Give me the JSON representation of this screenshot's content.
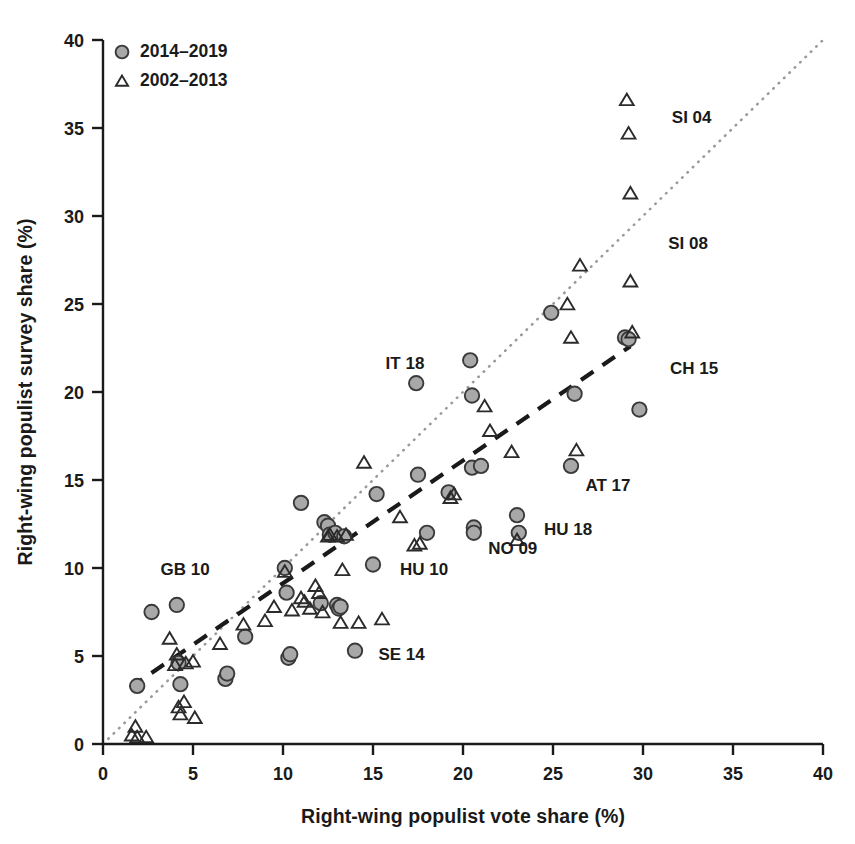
{
  "chart_data": {
    "type": "scatter",
    "title": "",
    "xlabel": "Right-wing populist vote share (%)",
    "ylabel": "Right-wing populist survey share (%)",
    "xlim": [
      0,
      40
    ],
    "ylim": [
      0,
      40
    ],
    "xticks": [
      0,
      5,
      10,
      15,
      20,
      25,
      30,
      35,
      40
    ],
    "yticks": [
      0,
      5,
      10,
      15,
      20,
      25,
      30,
      35,
      40
    ],
    "xtick_labels": [
      "0",
      "5",
      "10",
      "15",
      "20",
      "25",
      "30",
      "35",
      "40"
    ],
    "ytick_labels": [
      "0",
      "5",
      "10",
      "15",
      "20",
      "25",
      "30",
      "35",
      "40"
    ],
    "grid": false,
    "legend_position": "top-left",
    "colors": {
      "circle_fill": "#a8a8a8",
      "circle_edge": "#3a3a3a",
      "triangle_edge": "#2b2b2b",
      "triangle_fill": "none",
      "axis": "#1a1a1a",
      "identity_line": "#9a9a9a",
      "fit_line": "#1a1a1a"
    },
    "legend": [
      {
        "label": "2014–2019",
        "marker": "circle"
      },
      {
        "label": "2002–2013",
        "marker": "triangle"
      }
    ],
    "reference_lines": [
      {
        "name": "identity-line",
        "style": "dotted",
        "color": "#9a9a9a",
        "x0": 0,
        "y0": 0,
        "x1": 40,
        "y1": 40
      },
      {
        "name": "fit-line",
        "style": "dashed",
        "color": "#1a1a1a",
        "x0": 1.5,
        "y0": 3.2,
        "x1": 29.3,
        "y1": 22.6
      }
    ],
    "series": [
      {
        "name": "2014–2019",
        "marker": "circle",
        "points": [
          [
            1.9,
            3.3
          ],
          [
            2.7,
            7.5
          ],
          [
            4.1,
            7.9
          ],
          [
            4.2,
            4.6
          ],
          [
            4.3,
            3.4
          ],
          [
            6.8,
            3.7
          ],
          [
            6.9,
            4.0
          ],
          [
            7.9,
            6.1
          ],
          [
            10.1,
            10.0
          ],
          [
            10.2,
            8.6
          ],
          [
            10.3,
            4.9
          ],
          [
            10.4,
            5.1
          ],
          [
            11.0,
            13.7
          ],
          [
            12.1,
            8.0
          ],
          [
            12.3,
            12.6
          ],
          [
            12.5,
            12.4
          ],
          [
            12.6,
            11.9
          ],
          [
            12.9,
            12.0
          ],
          [
            13.0,
            7.9
          ],
          [
            13.1,
            7.7
          ],
          [
            13.2,
            7.8
          ],
          [
            13.4,
            11.8
          ],
          [
            14.0,
            5.3
          ],
          [
            15.0,
            10.2
          ],
          [
            15.2,
            14.2
          ],
          [
            17.4,
            20.5
          ],
          [
            17.5,
            15.3
          ],
          [
            18.0,
            12.0
          ],
          [
            19.2,
            14.3
          ],
          [
            20.4,
            21.8
          ],
          [
            20.5,
            19.8
          ],
          [
            20.5,
            15.7
          ],
          [
            20.6,
            12.3
          ],
          [
            20.6,
            12.0
          ],
          [
            21.0,
            15.8
          ],
          [
            23.0,
            13.0
          ],
          [
            23.1,
            12.0
          ],
          [
            24.9,
            24.5
          ],
          [
            26.0,
            15.8
          ],
          [
            26.2,
            19.9
          ],
          [
            29.0,
            23.1
          ],
          [
            29.2,
            23.0
          ],
          [
            29.8,
            19.0
          ]
        ]
      },
      {
        "name": "2002–2013",
        "marker": "triangle",
        "points": [
          [
            1.6,
            0.5
          ],
          [
            1.8,
            1.0
          ],
          [
            1.9,
            0.4
          ],
          [
            2.4,
            0.4
          ],
          [
            3.7,
            6.0
          ],
          [
            4.0,
            4.5
          ],
          [
            4.1,
            5.1
          ],
          [
            4.2,
            2.1
          ],
          [
            4.3,
            1.7
          ],
          [
            4.5,
            2.4
          ],
          [
            4.6,
            4.6
          ],
          [
            5.0,
            4.7
          ],
          [
            5.1,
            1.5
          ],
          [
            6.5,
            5.7
          ],
          [
            7.8,
            6.8
          ],
          [
            9.0,
            7.0
          ],
          [
            9.5,
            7.8
          ],
          [
            10.1,
            9.8
          ],
          [
            10.5,
            7.6
          ],
          [
            11.0,
            8.3
          ],
          [
            11.2,
            8.1
          ],
          [
            11.5,
            7.7
          ],
          [
            11.8,
            9.0
          ],
          [
            12.0,
            8.6
          ],
          [
            12.2,
            7.5
          ],
          [
            12.5,
            11.8
          ],
          [
            12.6,
            11.9
          ],
          [
            13.0,
            11.8
          ],
          [
            13.2,
            6.9
          ],
          [
            13.3,
            9.9
          ],
          [
            13.5,
            11.9
          ],
          [
            14.2,
            6.9
          ],
          [
            14.5,
            16.0
          ],
          [
            15.5,
            7.1
          ],
          [
            16.5,
            12.9
          ],
          [
            17.3,
            11.3
          ],
          [
            17.6,
            11.4
          ],
          [
            19.3,
            14.0
          ],
          [
            19.5,
            14.2
          ],
          [
            21.2,
            19.2
          ],
          [
            21.5,
            17.8
          ],
          [
            22.7,
            16.6
          ],
          [
            23.0,
            11.6
          ],
          [
            25.8,
            25.0
          ],
          [
            26.0,
            23.1
          ],
          [
            26.3,
            16.7
          ],
          [
            26.5,
            27.2
          ],
          [
            29.1,
            36.6
          ],
          [
            29.2,
            34.7
          ],
          [
            29.3,
            31.3
          ],
          [
            29.3,
            26.3
          ],
          [
            29.4,
            23.4
          ]
        ]
      }
    ],
    "annotations": [
      {
        "text": "SI 04",
        "x": 31.6,
        "y": 35.3
      },
      {
        "text": "SI 08",
        "x": 31.4,
        "y": 28.1
      },
      {
        "text": "CH 15",
        "x": 31.5,
        "y": 21.0
      },
      {
        "text": "AT 17",
        "x": 26.8,
        "y": 14.4
      },
      {
        "text": "HU 18",
        "x": 24.5,
        "y": 11.9
      },
      {
        "text": "NO 09",
        "x": 21.4,
        "y": 10.8
      },
      {
        "text": "IT 18",
        "x": 15.7,
        "y": 21.3
      },
      {
        "text": "HU 10",
        "x": 16.5,
        "y": 9.6
      },
      {
        "text": "SE 14",
        "x": 15.3,
        "y": 4.8
      },
      {
        "text": "GB 10",
        "x": 3.2,
        "y": 9.6
      }
    ]
  }
}
